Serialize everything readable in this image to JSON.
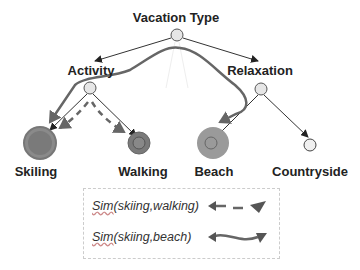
{
  "diagram": {
    "title": "Vacation Type",
    "nodes": [
      {
        "id": "vacation_type",
        "label": "Vacation Type",
        "x": 177,
        "y": 35,
        "r": 6,
        "color": "#e6e6e6"
      },
      {
        "id": "activity",
        "label": "Activity",
        "x": 90,
        "y": 88,
        "r": 6,
        "color": "#e6e6e6"
      },
      {
        "id": "relaxation",
        "label": "Relaxation",
        "x": 261,
        "y": 89,
        "r": 6,
        "color": "#e6e6e6"
      },
      {
        "id": "skiling",
        "label": "Skiling",
        "x": 40,
        "y": 143,
        "r": 16,
        "color": "#7a7a7a"
      },
      {
        "id": "walking",
        "label": "Walking",
        "x": 139,
        "y": 143,
        "r": 11,
        "color": "#7a7a7a"
      },
      {
        "id": "beach",
        "label": "Beach",
        "x": 213,
        "y": 143,
        "r": 16,
        "color": "#9a9a9a"
      },
      {
        "id": "countryside",
        "label": "Countryside",
        "x": 310,
        "y": 144,
        "r": 6,
        "color": "#eeeeee"
      }
    ],
    "edges": [
      [
        "vacation_type",
        "activity"
      ],
      [
        "vacation_type",
        "relaxation"
      ],
      [
        "activity",
        "skiling"
      ],
      [
        "activity",
        "walking"
      ],
      [
        "relaxation",
        "beach"
      ],
      [
        "relaxation",
        "countryside"
      ]
    ],
    "labels": {
      "vacation_type": "Vacation Type",
      "activity": "Activity",
      "relaxation": "Relaxation",
      "skiling": "Skiling",
      "walking": "Walking",
      "beach": "Beach",
      "countryside": "Countryside"
    }
  },
  "legend": {
    "items": [
      {
        "prefix": "Sim",
        "text": "(skiing,walking)",
        "style": "dashed-arrow"
      },
      {
        "prefix": "Sim",
        "text": "(skiing,beach)",
        "style": "solid-curved-arrow"
      }
    ]
  },
  "colors": {
    "edge": "#333333",
    "path": "#666666",
    "node_border": "#555555"
  }
}
